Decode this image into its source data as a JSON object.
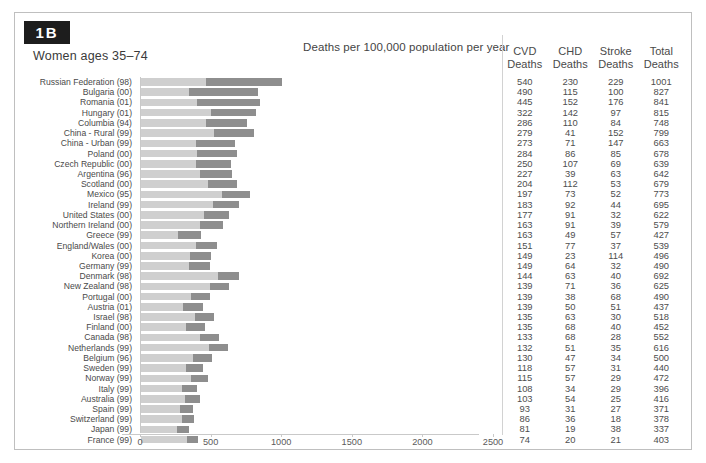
{
  "figure": {
    "badge": "1B",
    "subtitle": "Women ages 35–74",
    "main_title": "Deaths per 100,000 population per year"
  },
  "table": {
    "headers": [
      "CVD\nDeaths",
      "CHD\nDeaths",
      "Stroke\nDeaths",
      "Total\nDeaths"
    ],
    "header_lines": [
      [
        "CVD",
        "Deaths"
      ],
      [
        "CHD",
        "Deaths"
      ],
      [
        "Stroke",
        "Deaths"
      ],
      [
        "Total",
        "Deaths"
      ]
    ]
  },
  "colors": {
    "bar_light": "#cfcfcf",
    "bar_dark": "#8e8e8e",
    "badge_bg": "#1d1d1d",
    "border": "#bfbfbf",
    "text": "#4a4a4a"
  },
  "chart_data": {
    "type": "bar",
    "title": "Deaths per 100,000 population per year",
    "subtitle": "Women ages 35–74",
    "xlabel": "",
    "ylabel": "",
    "xlim": [
      0,
      2500
    ],
    "xticks": [
      0,
      500,
      1000,
      1500,
      2000,
      2500
    ],
    "xticklabels": [
      "0",
      "500",
      "1000",
      "1500",
      "2000",
      "2500"
    ],
    "grid": false,
    "legend": [],
    "orientation": "horizontal",
    "stacking": "stacked",
    "series": [
      {
        "name": "Non-CVD Deaths",
        "color": "#cfcfcf"
      },
      {
        "name": "CVD Deaths",
        "color": "#8e8e8e"
      }
    ],
    "categories": [
      "Russian Federation (98)",
      "Bulgaria (00)",
      "Romania (01)",
      "Hungary (01)",
      "Columbia (94)",
      "China - Rural (99)",
      "China - Urban (99)",
      "Poland (00)",
      "Czech Republic (00)",
      "Argentina (96)",
      "Scotland (00)",
      "Mexico (95)",
      "Ireland (99)",
      "United States (00)",
      "Northern Ireland (00)",
      "Greece (99)",
      "England/Wales (00)",
      "Korea (00)",
      "Germany (99)",
      "Denmark (98)",
      "New Zealand (98)",
      "Portugal (00)",
      "Austria (01)",
      "Israel (98)",
      "Finland (00)",
      "Canada (98)",
      "Netherlands (99)",
      "Belgium (96)",
      "Sweden (99)",
      "Norway (99)",
      "Italy (99)",
      "Australia (99)",
      "Spain (99)",
      "Switzerland (99)",
      "Japan (99)",
      "France (99)"
    ],
    "rows": [
      {
        "country": "Russian Federation (98)",
        "cvd": 540,
        "chd": 230,
        "stroke": 229,
        "total": 1001
      },
      {
        "country": "Bulgaria (00)",
        "cvd": 490,
        "chd": 115,
        "stroke": 100,
        "total": 827
      },
      {
        "country": "Romania (01)",
        "cvd": 445,
        "chd": 152,
        "stroke": 176,
        "total": 841
      },
      {
        "country": "Hungary (01)",
        "cvd": 322,
        "chd": 142,
        "stroke": 97,
        "total": 815
      },
      {
        "country": "Columbia (94)",
        "cvd": 286,
        "chd": 110,
        "stroke": 84,
        "total": 748
      },
      {
        "country": "China - Rural (99)",
        "cvd": 279,
        "chd": 41,
        "stroke": 152,
        "total": 799
      },
      {
        "country": "China - Urban (99)",
        "cvd": 273,
        "chd": 71,
        "stroke": 147,
        "total": 663
      },
      {
        "country": "Poland (00)",
        "cvd": 284,
        "chd": 86,
        "stroke": 85,
        "total": 678
      },
      {
        "country": "Czech Republic (00)",
        "cvd": 250,
        "chd": 107,
        "stroke": 69,
        "total": 639
      },
      {
        "country": "Argentina (96)",
        "cvd": 227,
        "chd": 39,
        "stroke": 63,
        "total": 642
      },
      {
        "country": "Scotland (00)",
        "cvd": 204,
        "chd": 112,
        "stroke": 53,
        "total": 679
      },
      {
        "country": "Mexico (95)",
        "cvd": 197,
        "chd": 73,
        "stroke": 52,
        "total": 773
      },
      {
        "country": "Ireland (99)",
        "cvd": 183,
        "chd": 92,
        "stroke": 44,
        "total": 695
      },
      {
        "country": "United States (00)",
        "cvd": 177,
        "chd": 91,
        "stroke": 32,
        "total": 622
      },
      {
        "country": "Northern Ireland (00)",
        "cvd": 163,
        "chd": 91,
        "stroke": 39,
        "total": 579
      },
      {
        "country": "Greece (99)",
        "cvd": 163,
        "chd": 49,
        "stroke": 57,
        "total": 427
      },
      {
        "country": "England/Wales (00)",
        "cvd": 151,
        "chd": 77,
        "stroke": 37,
        "total": 539
      },
      {
        "country": "Korea (00)",
        "cvd": 149,
        "chd": 23,
        "stroke": 114,
        "total": 496
      },
      {
        "country": "Germany (99)",
        "cvd": 149,
        "chd": 64,
        "stroke": 32,
        "total": 490
      },
      {
        "country": "Denmark (98)",
        "cvd": 144,
        "chd": 63,
        "stroke": 40,
        "total": 692
      },
      {
        "country": "New Zealand (98)",
        "cvd": 139,
        "chd": 71,
        "stroke": 36,
        "total": 625
      },
      {
        "country": "Portugal (00)",
        "cvd": 139,
        "chd": 38,
        "stroke": 68,
        "total": 490
      },
      {
        "country": "Austria (01)",
        "cvd": 139,
        "chd": 50,
        "stroke": 51,
        "total": 437
      },
      {
        "country": "Israel (98)",
        "cvd": 135,
        "chd": 63,
        "stroke": 30,
        "total": 518
      },
      {
        "country": "Finland (00)",
        "cvd": 135,
        "chd": 68,
        "stroke": 40,
        "total": 452
      },
      {
        "country": "Canada (98)",
        "cvd": 133,
        "chd": 68,
        "stroke": 28,
        "total": 552
      },
      {
        "country": "Netherlands (99)",
        "cvd": 132,
        "chd": 51,
        "stroke": 35,
        "total": 616
      },
      {
        "country": "Belgium (96)",
        "cvd": 130,
        "chd": 47,
        "stroke": 34,
        "total": 500
      },
      {
        "country": "Sweden (99)",
        "cvd": 118,
        "chd": 57,
        "stroke": 31,
        "total": 440
      },
      {
        "country": "Norway (99)",
        "cvd": 115,
        "chd": 57,
        "stroke": 29,
        "total": 472
      },
      {
        "country": "Italy (99)",
        "cvd": 108,
        "chd": 34,
        "stroke": 29,
        "total": 396
      },
      {
        "country": "Australia (99)",
        "cvd": 103,
        "chd": 54,
        "stroke": 25,
        "total": 416
      },
      {
        "country": "Spain (99)",
        "cvd": 93,
        "chd": 31,
        "stroke": 27,
        "total": 371
      },
      {
        "country": "Switzerland (99)",
        "cvd": 86,
        "chd": 36,
        "stroke": 18,
        "total": 378
      },
      {
        "country": "Japan (99)",
        "cvd": 81,
        "chd": 19,
        "stroke": 38,
        "total": 337
      },
      {
        "country": "France (99)",
        "cvd": 74,
        "chd": 20,
        "stroke": 21,
        "total": 403
      }
    ]
  }
}
